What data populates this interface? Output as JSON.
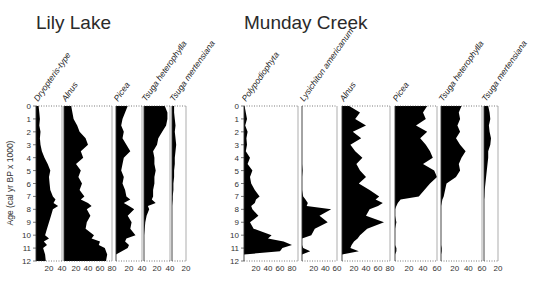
{
  "chart_data": [
    {
      "type": "area",
      "title": "Lily Lake",
      "ylabel": "Age (cal yr BP x 1000)",
      "ylim": [
        0,
        12
      ],
      "yticks": [
        0,
        1,
        2,
        3,
        4,
        5,
        6,
        7,
        8,
        9,
        10,
        11,
        12
      ],
      "depth": [
        0,
        0.5,
        1,
        1.5,
        2,
        2.5,
        3,
        3.5,
        4,
        4.5,
        5,
        5.5,
        6,
        6.5,
        7,
        7.25,
        7.5,
        7.75,
        8,
        8.5,
        9,
        9.5,
        10,
        10.25,
        10.5,
        10.75,
        11,
        11.5,
        12
      ],
      "series": [
        {
          "name": "Dryopteris-type",
          "xlim": [
            0,
            40
          ],
          "xticks": [
            20,
            40
          ],
          "values": [
            4,
            5,
            6,
            5,
            7,
            6,
            7,
            9,
            13,
            18,
            22,
            20,
            21,
            22,
            26,
            30,
            27,
            34,
            26,
            23,
            20,
            17,
            14,
            20,
            12,
            17,
            11,
            14,
            15
          ]
        },
        {
          "name": "Alnus",
          "xlim": [
            0,
            80
          ],
          "xticks": [
            20,
            40,
            60,
            80
          ],
          "values": [
            12,
            14,
            16,
            22,
            26,
            36,
            40,
            28,
            32,
            20,
            28,
            24,
            30,
            26,
            34,
            28,
            40,
            46,
            38,
            44,
            38,
            36,
            50,
            46,
            60,
            58,
            68,
            72,
            70
          ]
        },
        {
          "name": "Picea",
          "xlim": [
            0,
            40
          ],
          "xticks": [
            20,
            40
          ],
          "values": [
            18,
            14,
            10,
            8,
            12,
            10,
            16,
            22,
            12,
            10,
            8,
            12,
            10,
            14,
            16,
            22,
            12,
            20,
            28,
            18,
            24,
            22,
            30,
            16,
            14,
            20,
            18,
            0,
            0
          ]
        },
        {
          "name": "Tsuga heterophylla",
          "xlim": [
            0,
            40
          ],
          "xticks": [
            20,
            40
          ],
          "values": [
            32,
            36,
            36,
            34,
            28,
            22,
            20,
            14,
            16,
            16,
            18,
            16,
            16,
            14,
            14,
            12,
            18,
            6,
            8,
            4,
            2,
            1,
            0,
            0,
            0,
            0,
            0,
            0,
            0
          ]
        },
        {
          "name": "Tsuga mertensiana",
          "xlim": [
            0,
            20
          ],
          "xticks": [
            20
          ],
          "values": [
            3,
            3,
            4,
            5,
            4,
            5,
            6,
            5,
            4,
            4,
            3,
            3,
            2,
            2,
            1,
            1,
            0.5,
            0,
            0,
            0,
            0,
            0,
            0,
            0,
            0,
            0,
            0,
            0,
            0
          ]
        }
      ]
    },
    {
      "type": "area",
      "title": "Munday Creek",
      "ylabel": "",
      "ylim": [
        0,
        12
      ],
      "yticks": [
        0,
        1,
        2,
        3,
        4,
        5,
        6,
        7,
        8,
        9,
        10,
        11,
        12
      ],
      "depth": [
        0,
        0.5,
        1,
        1.5,
        2,
        2.5,
        3,
        3.5,
        4,
        4.5,
        5,
        5.5,
        6,
        6.5,
        7,
        7.25,
        7.5,
        7.75,
        8,
        8.5,
        9,
        9.5,
        10,
        10.25,
        10.5,
        10.75,
        11,
        11.25,
        11.5,
        12
      ],
      "series": [
        {
          "name": "Polypodiophyta",
          "xlim": [
            0,
            90
          ],
          "xticks": [
            20,
            40,
            60,
            80
          ],
          "values": [
            1,
            3,
            5,
            2,
            6,
            4,
            5,
            3,
            10,
            6,
            14,
            10,
            12,
            18,
            26,
            20,
            18,
            12,
            14,
            24,
            10,
            16,
            46,
            40,
            66,
            80,
            64,
            60,
            0,
            0
          ]
        },
        {
          "name": "Lysichiton americanum",
          "xlim": [
            0,
            60
          ],
          "xticks": [
            20,
            40,
            60
          ],
          "values": [
            0,
            0,
            0,
            0,
            0,
            0,
            0,
            0,
            0,
            0,
            1,
            0,
            0,
            0,
            2,
            6,
            10,
            8,
            50,
            30,
            44,
            22,
            16,
            0,
            0,
            0,
            2,
            14,
            0,
            0
          ]
        },
        {
          "name": "Alnus",
          "xlim": [
            0,
            80
          ],
          "xticks": [
            20,
            40,
            60,
            80
          ],
          "values": [
            12,
            30,
            22,
            40,
            18,
            32,
            14,
            22,
            34,
            24,
            30,
            40,
            28,
            46,
            62,
            56,
            68,
            60,
            46,
            40,
            70,
            42,
            30,
            26,
            20,
            16,
            14,
            28,
            0,
            0
          ]
        },
        {
          "name": "Picea",
          "xlim": [
            0,
            60
          ],
          "xticks": [
            20,
            40,
            60
          ],
          "values": [
            46,
            40,
            44,
            30,
            46,
            36,
            44,
            50,
            54,
            40,
            56,
            62,
            50,
            42,
            34,
            8,
            4,
            2,
            0,
            0,
            2,
            0,
            0,
            0,
            0,
            0,
            2,
            2,
            0,
            0
          ]
        },
        {
          "name": "Tsuga heterophylla",
          "xlim": [
            0,
            60
          ],
          "xticks": [
            20,
            40,
            60
          ],
          "values": [
            30,
            26,
            28,
            24,
            28,
            22,
            28,
            36,
            30,
            26,
            28,
            22,
            8,
            6,
            4,
            2,
            1,
            0,
            0,
            0,
            0,
            0,
            0,
            0,
            0,
            0,
            1,
            1,
            0,
            0
          ]
        },
        {
          "name": "Tsuga mertensiana",
          "xlim": [
            0,
            20
          ],
          "xticks": [
            20
          ],
          "values": [
            6,
            8,
            9,
            7,
            8,
            10,
            9,
            6,
            6,
            5,
            4,
            3,
            2,
            1,
            0.5,
            0,
            0,
            0,
            0,
            0,
            0,
            0,
            0,
            0,
            0,
            0,
            0,
            0,
            0,
            0
          ]
        }
      ]
    }
  ]
}
